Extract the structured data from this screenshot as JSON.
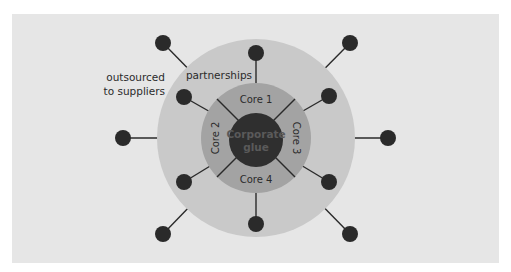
{
  "diagram": {
    "colors": {
      "page_background": "#ffffff",
      "panel_background": "#e6e6e6",
      "outer_ring": "#c9c9c9",
      "middle_ring": "#a3a3a3",
      "core": "#2f2f2f",
      "node": "#2a2a2a",
      "spoke": "#2a2a2a",
      "text": "#2b2b2b",
      "core_text": "#5a5a5a"
    },
    "labels": {
      "outsourced_line1": "outsourced",
      "outsourced_line2": "to suppliers",
      "partnerships": "partnerships",
      "core1": "Core 1",
      "core2": "Core 2",
      "core3": "Core 3",
      "core4": "Core 4",
      "center_line1": "Corporate",
      "center_line2": "glue"
    },
    "rings": [
      {
        "name": "outsourced to suppliers",
        "role": "background area"
      },
      {
        "name": "partnerships",
        "role": "outer ring"
      },
      {
        "name": "Core 1-4",
        "role": "middle ring, 4 segments"
      },
      {
        "name": "Corporate glue",
        "role": "center"
      }
    ],
    "nodes": {
      "outer": 6,
      "partnership": 4
    }
  }
}
